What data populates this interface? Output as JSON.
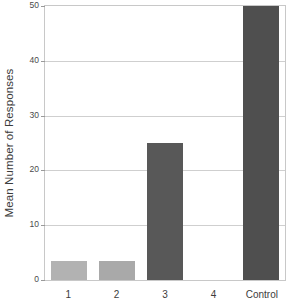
{
  "chart_data": {
    "type": "bar",
    "title": "",
    "xlabel": "",
    "ylabel": "Mean Number of Responses",
    "categories": [
      "1",
      "2",
      "3",
      "4",
      "Control"
    ],
    "values": [
      3.5,
      3.5,
      25,
      0,
      50
    ],
    "ylim": [
      0,
      50
    ],
    "yticks": [
      0,
      10,
      20,
      30,
      40,
      50
    ],
    "ytick_labels": [
      "0",
      "10",
      "20",
      "30",
      "40",
      "50"
    ],
    "grid": true,
    "legend": "none",
    "bar_colors": [
      "#b2b2b2",
      "#a9a9a9",
      "#585858",
      "#585858",
      "#4f4f4f"
    ],
    "axis_color": "#c8c8c8",
    "grid_color": "#cfcfcf",
    "background": "#ffffff"
  }
}
